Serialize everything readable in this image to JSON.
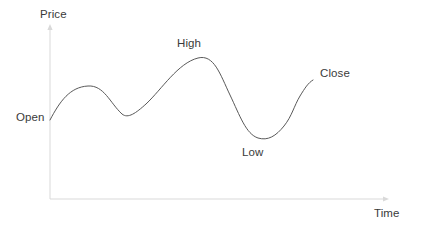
{
  "figure": {
    "title": "",
    "background_color": "#ffffff",
    "width": 422,
    "height": 229
  },
  "axes": {
    "y_axis_label": "Price",
    "x_axis_label": "Time",
    "axis_color": "#d9d9d9",
    "y_axis_arrow": "arrow-up-icon",
    "x_axis_arrow": "arrow-right-icon",
    "origin_x": 50,
    "origin_y": 199,
    "x_axis_end": 387,
    "y_axis_top": 26
  },
  "annotations": [
    {
      "name": "open",
      "label": "Open",
      "x": 50,
      "y": 120
    },
    {
      "name": "high",
      "label": "High",
      "x": 198,
      "y": 58
    },
    {
      "name": "low",
      "label": "Low",
      "x": 255,
      "y": 138
    },
    {
      "name": "close",
      "label": "Close",
      "x": 313,
      "y": 80
    }
  ],
  "curve": {
    "color": "#595959",
    "width": 1,
    "path": "M 50 120 C 60 101, 70 87, 88 86 C 104 85, 110 103, 122 114 C 128 119, 136 113, 146 104 C 162 89, 178 63, 198 58 C 214 54, 220 74, 230 95 C 240 116, 246 134, 258 138 C 268 141, 276 136, 284 126 C 292 116, 294 106, 300 96 C 305 88, 308 83, 313 80"
  },
  "chart_data": {
    "type": "line",
    "title": "",
    "xlabel": "Time",
    "ylabel": "Price",
    "grid": false,
    "legend": "none",
    "xlim": [
      0,
      100
    ],
    "ylim": [
      0,
      100
    ],
    "annotations": [
      "Open",
      "High",
      "Low",
      "Close"
    ],
    "series": [
      {
        "name": "Price",
        "x": [
          0,
          5,
          11,
          16,
          21,
          25,
          29,
          33,
          37,
          42,
          46,
          50,
          54,
          58,
          62,
          66,
          70,
          74,
          78,
          82,
          86,
          90,
          94,
          98
        ],
        "values": [
          46,
          52,
          58,
          63,
          66,
          65,
          60,
          53,
          48,
          49,
          53,
          58,
          65,
          73,
          80,
          83,
          81,
          74,
          65,
          54,
          44,
          38,
          36,
          38
        ]
      }
    ],
    "keypoints": [
      {
        "label": "Open",
        "x": 0,
        "y": 46
      },
      {
        "label": "High",
        "x": 66,
        "y": 83
      },
      {
        "label": "Low",
        "x": 94,
        "y": 36
      },
      {
        "label": "Close",
        "x": 100,
        "y": 60
      }
    ]
  }
}
